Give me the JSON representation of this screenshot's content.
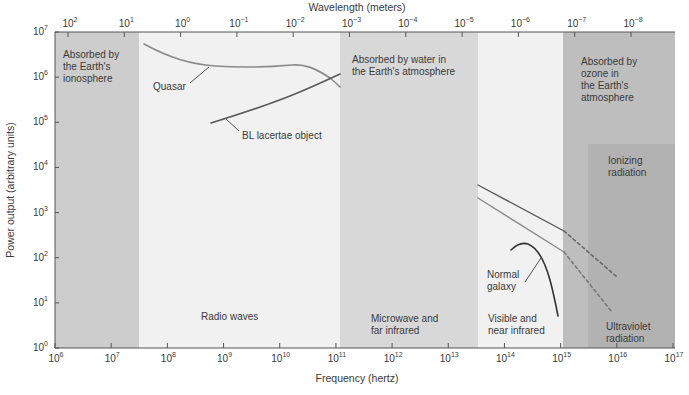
{
  "chart_data": {
    "type": "line",
    "title": "",
    "xlabel": "Frequency (hertz)",
    "x2label": "Wavelength (meters)",
    "ylabel": "Power output (arbitrary units)",
    "xscale": "log",
    "yscale": "log",
    "xlim": [
      1000000.0,
      1e+17
    ],
    "ylim": [
      1,
      10000000.0
    ],
    "grid": false,
    "x_ticks": [
      "10^6",
      "10^7",
      "10^8",
      "10^9",
      "10^10",
      "10^11",
      "10^12",
      "10^13",
      "10^14",
      "10^15",
      "10^16",
      "10^17"
    ],
    "x2_ticks": [
      "10^2",
      "10^1",
      "10^0",
      "10^-1",
      "10^-2",
      "10^-3",
      "10^-4",
      "10^-5",
      "10^-6",
      "10^-7",
      "10^-8"
    ],
    "y_ticks": [
      "10^0",
      "10^1",
      "10^2",
      "10^3",
      "10^4",
      "10^5",
      "10^6",
      "10^7"
    ],
    "bands": [
      {
        "name": "Absorbed by the Earth's ionosphere",
        "from_hz": 1000000.0,
        "to_hz": 30000000.0,
        "shade": "#cfcfcf"
      },
      {
        "name": "Radio waves",
        "from_hz": 30000000.0,
        "to_hz": 110000000000.0,
        "shade": "#f2f2f2"
      },
      {
        "name": "Absorbed by water in the Earth's atmosphere / Microwave and far infrared",
        "from_hz": 110000000000.0,
        "to_hz": 30000000000000.0,
        "shade": "#d9d9d9"
      },
      {
        "name": "Visible and near infrared",
        "from_hz": 30000000000000.0,
        "to_hz": 1000000000000000.0,
        "shade": "#f2f2f2"
      },
      {
        "name": "Absorbed by ozone in the Earth's atmosphere / Ultraviolet radiation",
        "from_hz": 1000000000000000.0,
        "to_hz": 1e+17,
        "shade": "#bdbdbd"
      },
      {
        "name": "Ionizing radiation",
        "from_hz": 3000000000000000.0,
        "to_hz": 1e+17,
        "y_max": 15000.0,
        "shade": "#b3b3b3"
      }
    ],
    "series": [
      {
        "name": "Quasar",
        "style": "solid",
        "color": "#8a8a8a",
        "points": [
          [
            30000000.0,
            5000000.0
          ],
          [
            100000000.0,
            3000000.0
          ],
          [
            500000000.0,
            1700000.0
          ],
          [
            3000000000.0,
            1500000.0
          ],
          [
            10000000000.0,
            1600000.0
          ],
          [
            20000000000.0,
            1700000.0
          ],
          [
            50000000000.0,
            1100000.0
          ],
          [
            110000000000.0,
            500000.0
          ]
        ]
      },
      {
        "name": "BL lacertae object",
        "style": "solid",
        "color": "#5a5a5a",
        "points": [
          [
            600000000.0,
            100000.0
          ],
          [
            3000000000.0,
            160000.0
          ],
          [
            10000000000.0,
            280000.0
          ],
          [
            30000000000.0,
            500000.0
          ],
          [
            110000000000.0,
            1200000.0
          ]
        ]
      },
      {
        "name": "Quasar (high-frequency, upper)",
        "style": "solid-then-dashed",
        "color": "#5a5a5a",
        "points": [
          [
            30000000000000.0,
            17000.0
          ],
          [
            1000000000000000.0,
            350.0
          ],
          [
            1e+16,
            35.0
          ]
        ]
      },
      {
        "name": "BL lacertae (high-frequency, lower)",
        "style": "solid-then-dashed",
        "color": "#8a8a8a",
        "points": [
          [
            30000000000000.0,
            8500.0
          ],
          [
            1000000000000000.0,
            120.0
          ],
          [
            8000000000000000.0,
            6.0
          ]
        ]
      },
      {
        "name": "Normal galaxy",
        "style": "solid",
        "color": "#3a3a3a",
        "points": [
          [
            120000000000000.0,
            150.0
          ],
          [
            200000000000000.0,
            200.0
          ],
          [
            400000000000000.0,
            140.0
          ],
          [
            600000000000000.0,
            30.0
          ],
          [
            800000000000000.0,
            5.0
          ]
        ]
      }
    ],
    "annotations": [
      "Absorbed by the Earth's ionosphere",
      "Absorbed by water in the Earth's atmosphere",
      "Absorbed by ozone in the Earth's atmosphere",
      "Ionizing radiation",
      "Radio waves",
      "Microwave and far infrared",
      "Visible and near infrared",
      "Ultraviolet radiation",
      "Quasar",
      "BL lacertae object",
      "Normal galaxy"
    ]
  },
  "labels": {
    "x_title": "Frequency (hertz)",
    "x2_title": "Wavelength (meters)",
    "y_title": "Power output (arbitrary units)",
    "ionosphere": [
      "Absorbed by",
      "the Earth's",
      "ionosphere"
    ],
    "water": [
      "Absorbed by water in",
      "the Earth's atmosphere"
    ],
    "ozone": [
      "Absorbed by",
      "ozone in",
      "the Earth's",
      "atmosphere"
    ],
    "ionizing": [
      "Ionizing",
      "radiation"
    ],
    "radio": "Radio waves",
    "microwave": [
      "Microwave and",
      "far infrared"
    ],
    "visible": [
      "Visible and",
      "near infrared"
    ],
    "ultraviolet": [
      "Ultraviolet",
      "radiation"
    ],
    "quasar": "Quasar",
    "bllac": "BL lacertae object",
    "galaxy": [
      "Normal",
      "galaxy"
    ]
  },
  "x_ticks": [
    {
      "base": "10",
      "exp": "6"
    },
    {
      "base": "10",
      "exp": "7"
    },
    {
      "base": "10",
      "exp": "8"
    },
    {
      "base": "10",
      "exp": "9"
    },
    {
      "base": "10",
      "exp": "10"
    },
    {
      "base": "10",
      "exp": "11"
    },
    {
      "base": "10",
      "exp": "12"
    },
    {
      "base": "10",
      "exp": "13"
    },
    {
      "base": "10",
      "exp": "14"
    },
    {
      "base": "10",
      "exp": "15"
    },
    {
      "base": "10",
      "exp": "16"
    },
    {
      "base": "10",
      "exp": "17"
    }
  ],
  "x2_ticks": [
    {
      "base": "10",
      "exp": "2"
    },
    {
      "base": "10",
      "exp": "1"
    },
    {
      "base": "10",
      "exp": "0"
    },
    {
      "base": "10",
      "exp": "−1"
    },
    {
      "base": "10",
      "exp": "−2"
    },
    {
      "base": "10",
      "exp": "−3"
    },
    {
      "base": "10",
      "exp": "−4"
    },
    {
      "base": "10",
      "exp": "−5"
    },
    {
      "base": "10",
      "exp": "−6"
    },
    {
      "base": "10",
      "exp": "−7"
    },
    {
      "base": "10",
      "exp": "−8"
    }
  ],
  "y_ticks": [
    {
      "base": "10",
      "exp": "0"
    },
    {
      "base": "10",
      "exp": "1"
    },
    {
      "base": "10",
      "exp": "2"
    },
    {
      "base": "10",
      "exp": "3"
    },
    {
      "base": "10",
      "exp": "4"
    },
    {
      "base": "10",
      "exp": "5"
    },
    {
      "base": "10",
      "exp": "6"
    },
    {
      "base": "10",
      "exp": "7"
    }
  ]
}
